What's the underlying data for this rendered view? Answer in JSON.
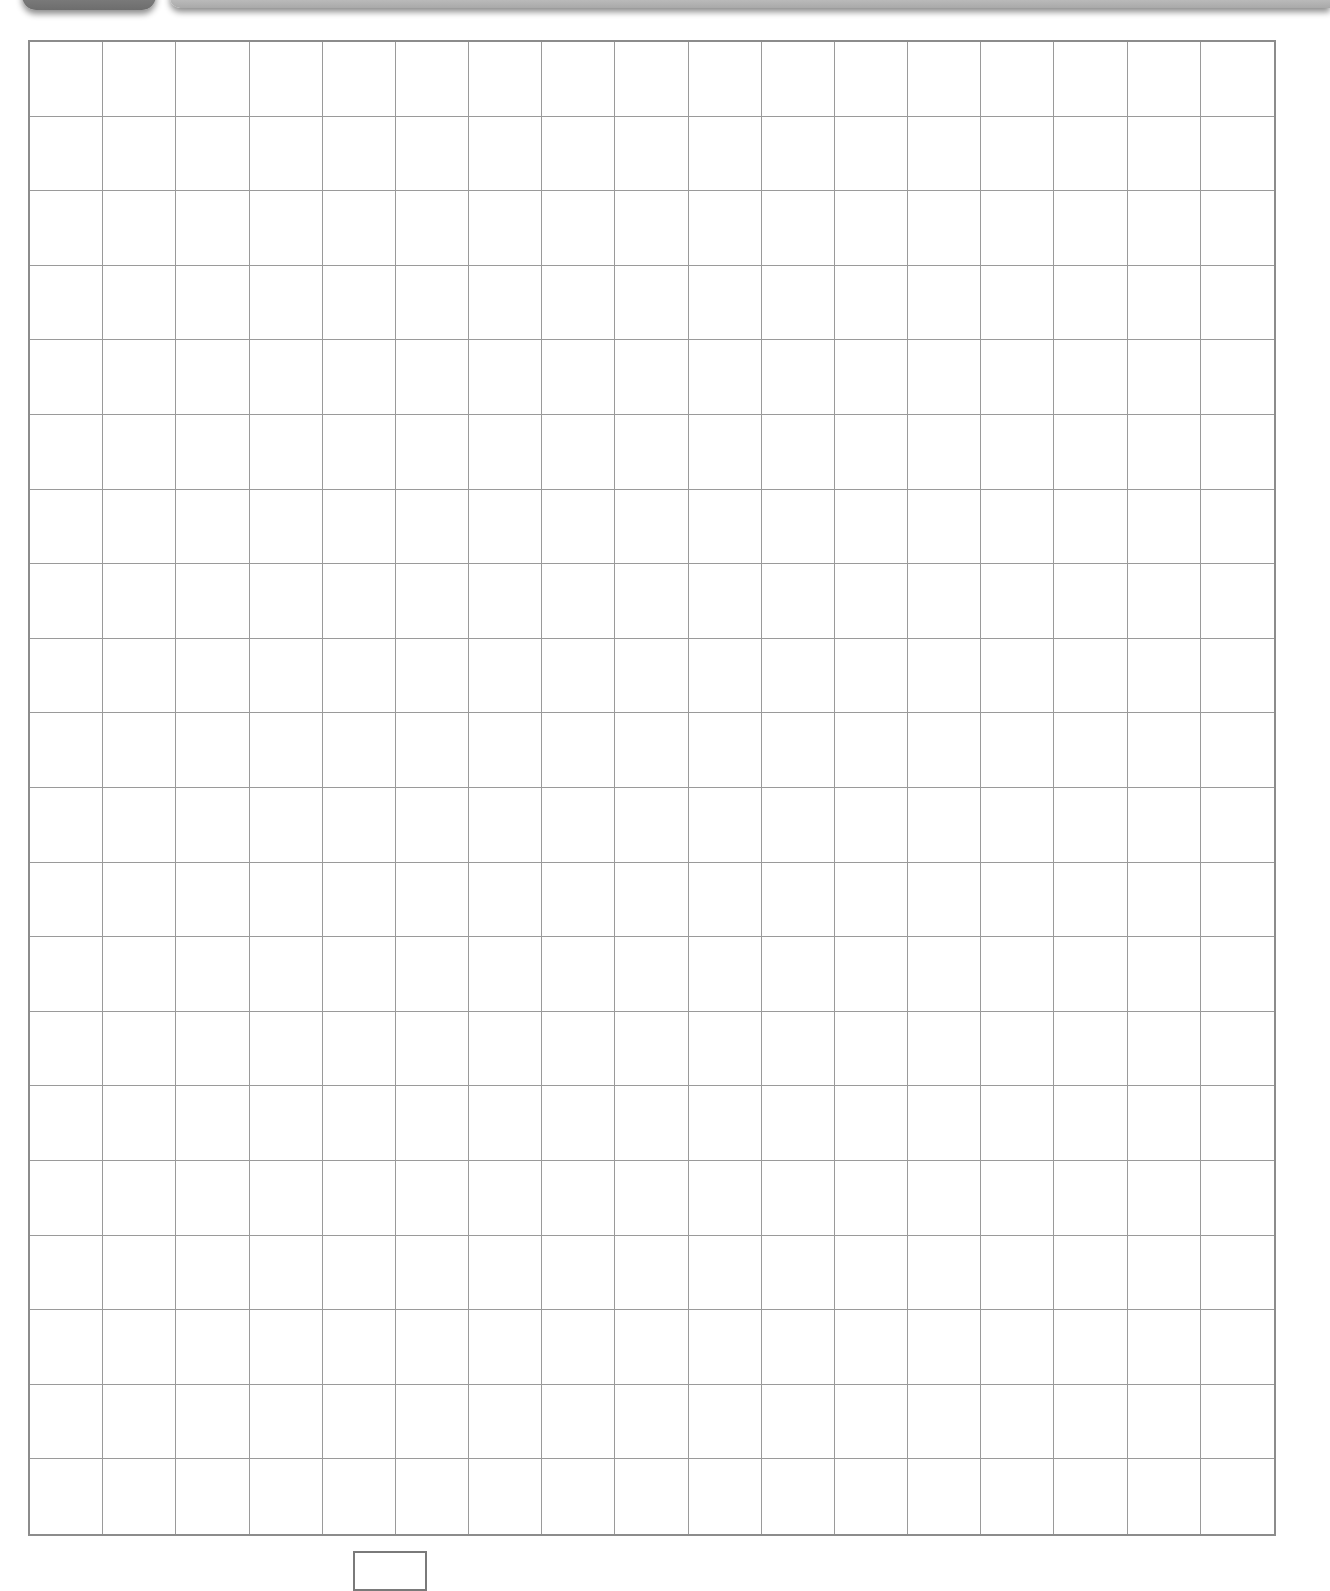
{
  "header": {
    "tab_color": "#7a7a7a",
    "bar_color": "#bdbdbd"
  },
  "grid": {
    "columns": 17,
    "rows": 20,
    "line_color": "#9a9a9a",
    "frame_color": "#8c8c8c",
    "cells_filled": []
  },
  "answer_box": {
    "value": ""
  }
}
